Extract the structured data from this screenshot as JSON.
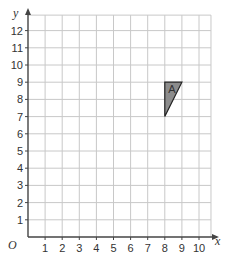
{
  "diagram": {
    "type": "coordinate-grid",
    "x_axis": {
      "label": "x",
      "ticks": [
        "1",
        "2",
        "3",
        "4",
        "5",
        "6",
        "7",
        "8",
        "9",
        "10"
      ],
      "min": 0,
      "max": 10.7
    },
    "y_axis": {
      "label": "y",
      "ticks": [
        "1",
        "2",
        "3",
        "4",
        "5",
        "6",
        "7",
        "8",
        "9",
        "10",
        "11",
        "12"
      ],
      "min": 0,
      "max": 12.9
    },
    "origin_label": "O",
    "shape": {
      "name": "A",
      "vertices": [
        [
          8,
          9
        ],
        [
          9,
          9
        ],
        [
          8,
          7
        ]
      ],
      "fill": "#8c8c8c",
      "stroke": "#222222"
    },
    "colors": {
      "grid": "#c8c8c8",
      "axis": "#444444"
    }
  }
}
